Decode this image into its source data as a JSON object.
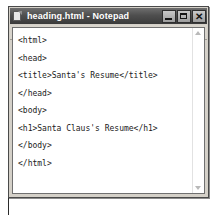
{
  "window": {
    "title": "heading.html - Notepad",
    "icon": "notepad-document-icon",
    "controls": {
      "minimize_label": "–",
      "maximize_label": "☐",
      "close_label": "✕"
    }
  },
  "menu": {
    "items": [
      {
        "label": "File",
        "mnemonic": "F"
      },
      {
        "label": "Edit",
        "mnemonic": "E"
      },
      {
        "label": "Format",
        "mnemonic": "o"
      },
      {
        "label": "View",
        "mnemonic": "V"
      },
      {
        "label": "Help",
        "mnemonic": "H"
      }
    ]
  },
  "editor": {
    "lines": [
      "<html>",
      "<head>",
      "<title>Santa's Resume</title>",
      "</head>",
      "<body>",
      "<h1>Santa Claus's Resume</h1>",
      "</body>",
      "</html>"
    ]
  },
  "scrollbar": {
    "up_arrow": "scroll-up-arrow-icon",
    "down_arrow": "scroll-down-arrow-icon"
  },
  "annotation": {
    "target_line_index": 5,
    "arrow": "callout-arrow-icon"
  },
  "colors": {
    "titlebar": "#4f4f4f",
    "title_text": "#ffffff",
    "window_face": "#d4d0c8",
    "menubar": "#d8d4cc",
    "editor_bg": "#ffffff",
    "code_text": "#1a1a1a",
    "annotation": "#2b2b2b"
  }
}
